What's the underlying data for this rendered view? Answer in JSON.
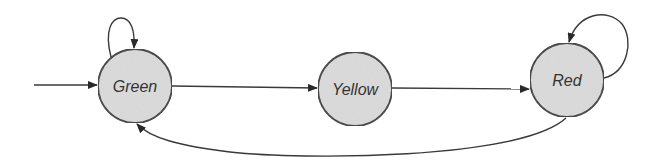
{
  "diagram": {
    "type": "state-machine",
    "colors": {
      "node_fill": "#dcdcdc",
      "node_stroke": "#2e2e2e",
      "edge": "#3a3a3a",
      "label": "#333333"
    },
    "states": [
      {
        "id": "green",
        "label": "Green",
        "cx": 135,
        "cy": 86,
        "r": 37
      },
      {
        "id": "yellow",
        "label": "Yellow",
        "cx": 355,
        "cy": 89,
        "r": 37
      },
      {
        "id": "red",
        "label": "Red",
        "cx": 567,
        "cy": 80,
        "r": 37
      }
    ],
    "transitions": [
      {
        "from": "start",
        "to": "Green",
        "kind": "initial"
      },
      {
        "from": "Green",
        "to": "Green",
        "kind": "self-loop"
      },
      {
        "from": "Green",
        "to": "Yellow",
        "kind": "straight"
      },
      {
        "from": "Yellow",
        "to": "Red",
        "kind": "straight"
      },
      {
        "from": "Red",
        "to": "Red",
        "kind": "self-loop"
      },
      {
        "from": "Red",
        "to": "Green",
        "kind": "curved-return"
      }
    ]
  }
}
